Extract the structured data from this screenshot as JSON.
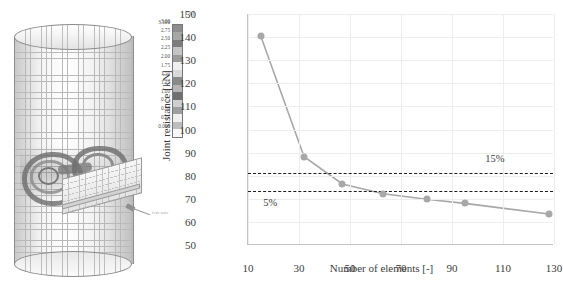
{
  "figure": {
    "left_panel": {
      "name": "fem-model",
      "description": "Finite element mesh of tubular joint with gusset plate",
      "annotation_label": "fem-note",
      "legend": {
        "unit": "[%]",
        "top_value": "3.100",
        "ticks": [
          "3.00",
          "2.75",
          "2.50",
          "2.25",
          "2.00",
          "1.75",
          "1.50",
          "1.25",
          "1.00",
          "0.75",
          "0.50",
          "0.25"
        ],
        "bottom_value": "0.000",
        "band_colors": [
          "#8e8e8e",
          "#a6a6a6",
          "#7c7c7c",
          "#c4c4c4",
          "#9b9b9b",
          "#efefef",
          "#d8d8d8",
          "#8a8a8a",
          "#b5b5b5",
          "#6f6f6f",
          "#cfcfcf",
          "#9e9e9e",
          "#efefef",
          "#bdbdbd",
          "#f7f7f7"
        ]
      }
    }
  },
  "chart_data": {
    "type": "line",
    "title": "",
    "xlabel": "Number of elements [-]",
    "ylabel": "Joint resistance [kN]",
    "xlim": [
      10,
      130
    ],
    "ylim": [
      50,
      150
    ],
    "xticks": [
      10,
      30,
      50,
      70,
      90,
      110,
      130
    ],
    "yticks": [
      50,
      60,
      70,
      80,
      90,
      100,
      110,
      120,
      130,
      140,
      150
    ],
    "grid": true,
    "legend_position": "none",
    "series": [
      {
        "name": "Joint resistance convergence",
        "color": "#a8a8a8",
        "marker": "circle",
        "x": [
          15,
          32,
          47,
          63,
          80,
          95,
          128
        ],
        "y": [
          140.5,
          88.2,
          76.4,
          72.2,
          69.8,
          68.0,
          63.4
        ]
      }
    ],
    "reference_lines": [
      {
        "label": "15%",
        "value": 81.0,
        "style": "dashed",
        "color": "#1d1d1d"
      },
      {
        "label": "5%",
        "value": 73.5,
        "style": "dashed",
        "color": "#1d1d1d"
      }
    ]
  }
}
